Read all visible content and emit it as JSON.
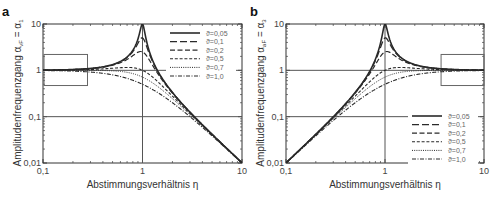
{
  "chart_data": [
    {
      "panel": "a",
      "type": "line",
      "title": "",
      "xlabel": "Abstimmungsverhältnis η",
      "ylabel": "Amplitudenfrequenzgang α_vF = α_1",
      "ylabel_main": "Amplitudenfrequenzgang ",
      "ylabel_math": "α",
      "ylabel_sub1": "vF",
      "ylabel_eq": " = α",
      "ylabel_sub2": "1",
      "xscale": "log",
      "yscale": "log",
      "xlim": [
        0.1,
        10
      ],
      "ylim": [
        0.01,
        10
      ],
      "xticks": [
        "0,1",
        "1",
        "10"
      ],
      "yticks": [
        "0,01",
        "0,1",
        "1",
        "10"
      ],
      "reference_lines": {
        "horizontal": [
          1,
          0.1
        ],
        "vertical": [
          1
        ]
      },
      "highlight_box": {
        "x": [
          0.1,
          0.28
        ],
        "y": [
          0.47,
          2.2
        ]
      },
      "legend_position": "upper right",
      "formula": "1/sqrt((1-η²)² + (2ϑη)²)",
      "series": [
        {
          "name": "ϑ=0,05",
          "damping": 0.05,
          "style": "solid",
          "peak": 10
        },
        {
          "name": "ϑ=0,1",
          "damping": 0.1,
          "style": "long-dash",
          "peak": 5
        },
        {
          "name": "ϑ=0,2",
          "damping": 0.2,
          "style": "dash",
          "peak": 2.5
        },
        {
          "name": "ϑ=0,5",
          "damping": 0.5,
          "style": "short-dash",
          "peak": 1.15
        },
        {
          "name": "ϑ=0,7",
          "damping": 0.7,
          "style": "dotted",
          "peak": 1.0
        },
        {
          "name": "ϑ=1,0",
          "damping": 1.0,
          "style": "dash-dot",
          "peak": 1.0
        }
      ]
    },
    {
      "panel": "b",
      "type": "line",
      "title": "",
      "xlabel": "Abstimmungsverhältnis η",
      "ylabel": "Amplitudenfrequenzgang α_aF = α_3",
      "ylabel_main": "Amplitudenfrequenzgang ",
      "ylabel_math": "α",
      "ylabel_sub1": "aF",
      "ylabel_eq": " = α",
      "ylabel_sub2": "3",
      "xscale": "log",
      "yscale": "log",
      "xlim": [
        0.1,
        10
      ],
      "ylim": [
        0.01,
        10
      ],
      "xticks": [
        "0,1",
        "1",
        "10"
      ],
      "yticks": [
        "0,01",
        "0,1",
        "1",
        "10"
      ],
      "reference_lines": {
        "horizontal": [
          1,
          0.1
        ],
        "vertical": [
          1
        ]
      },
      "highlight_box": {
        "x": [
          3.6,
          10
        ],
        "y": [
          0.47,
          2.2
        ]
      },
      "legend_position": "lower right",
      "formula": "η²/sqrt((1-η²)² + (2ϑη)²)",
      "series": [
        {
          "name": "ϑ=0,05",
          "damping": 0.05,
          "style": "solid",
          "peak": 10
        },
        {
          "name": "ϑ=0,1",
          "damping": 0.1,
          "style": "long-dash",
          "peak": 5
        },
        {
          "name": "ϑ=0,2",
          "damping": 0.2,
          "style": "dash",
          "peak": 2.5
        },
        {
          "name": "ϑ=0,5",
          "damping": 0.5,
          "style": "short-dash",
          "peak": 1.15
        },
        {
          "name": "ϑ=0,7",
          "damping": 0.7,
          "style": "dotted",
          "peak": 1.0
        },
        {
          "name": "ϑ=1,0",
          "damping": 1.0,
          "style": "dash-dot",
          "peak": 1.0
        }
      ]
    }
  ],
  "panels": {
    "a": {
      "letter": "a",
      "xlabel": "Abstimmungsverhältnis η"
    },
    "b": {
      "letter": "b",
      "xlabel": "Abstimmungsverhältnis η"
    }
  },
  "styles": {
    "line_color": "#2a2a2a",
    "grid_line_color": "#555555",
    "box_color": "#666666"
  }
}
